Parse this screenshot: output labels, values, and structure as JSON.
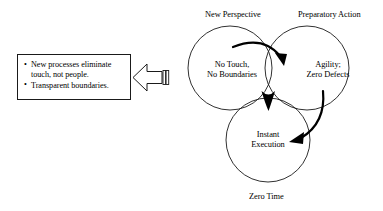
{
  "diagram": {
    "type": "venn-three-circle",
    "title_labels": {
      "top_left": "New Perspective",
      "top_right": "Preparatory Action",
      "bottom": "Zero Time"
    },
    "circles": [
      {
        "name": "new-perspective",
        "outer_label": "New Perspective",
        "inner_line_1": "No Touch,",
        "inner_line_2": "No Boundaries"
      },
      {
        "name": "preparatory-action",
        "outer_label": "Preparatory Action",
        "inner_line_1": "Agility;",
        "inner_line_2": "Zero Defects"
      },
      {
        "name": "zero-time",
        "outer_label": "Zero Time",
        "inner_line_1": "Instant",
        "inner_line_2": "Execution"
      }
    ],
    "callout": {
      "bullets": [
        "New processes eliminate touch, not people.",
        "Transparent boundaries."
      ]
    },
    "arrows": {
      "block_arrow_direction": "left",
      "flow_arrow_1": "new-perspective-to-preparatory-action",
      "flow_arrow_2": "preparatory-action-to-zero-time"
    },
    "colors": {
      "stroke": "#1a1a1a",
      "fill": "#000000",
      "background": "#ffffff"
    }
  }
}
